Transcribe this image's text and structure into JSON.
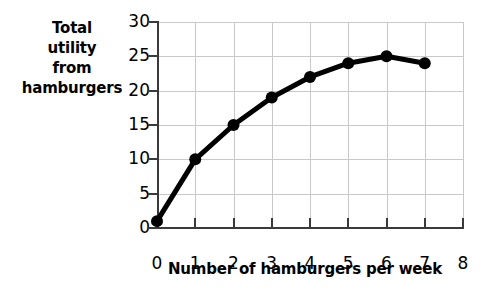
{
  "chart_data": {
    "type": "line",
    "title": "",
    "xlabel": "Number of hamburgers per week",
    "ylabel": "Total utility from hamburgers",
    "ylabel_lines": [
      "Total",
      "utility",
      "from",
      "hamburgers"
    ],
    "x": [
      0,
      1,
      2,
      3,
      4,
      5,
      6,
      7
    ],
    "values": [
      1,
      10,
      15,
      19,
      22,
      24,
      25,
      24
    ],
    "series": [
      {
        "name": "Total utility from hamburgers",
        "x": [
          0,
          1,
          2,
          3,
          4,
          5,
          6,
          7
        ],
        "values": [
          1,
          10,
          15,
          19,
          22,
          24,
          25,
          24
        ]
      }
    ],
    "xlim": [
      0,
      8
    ],
    "ylim": [
      0,
      30
    ],
    "xticks": [
      0,
      1,
      2,
      3,
      4,
      5,
      6,
      7,
      8
    ],
    "xtick_labels": [
      "0",
      "1",
      "2",
      "3",
      "4",
      "5",
      "6",
      "7",
      "8"
    ],
    "yticks": [
      0,
      5,
      10,
      15,
      20,
      25,
      30
    ],
    "ytick_labels": [
      "0",
      "5",
      "10",
      "15",
      "20",
      "25",
      "30"
    ],
    "grid": true,
    "grid_color": "#c9c9c9",
    "legend": false,
    "legend_position": "none",
    "line_color": "#000000",
    "marker": "circle",
    "marker_color": "#000000",
    "axis_color": "#3a3a3a",
    "background_color": "#ffffff"
  }
}
